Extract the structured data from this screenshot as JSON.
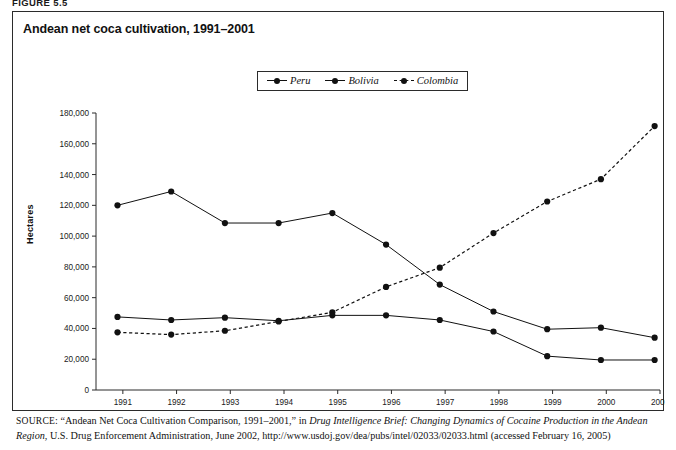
{
  "figure": {
    "label": "FIGURE 5.5",
    "title": "Andean net coca cultivation, 1991–2001"
  },
  "legend": {
    "items": [
      {
        "name": "Peru",
        "label": "Peru",
        "style": "solid",
        "color": "#111111"
      },
      {
        "name": "Bolivia",
        "label": "Bolivia",
        "style": "solid",
        "color": "#111111"
      },
      {
        "name": "Colombia",
        "label": "Colombia",
        "style": "dashed",
        "color": "#111111"
      }
    ]
  },
  "axes": {
    "y_title": "Hectares",
    "y_ticks": [
      "0",
      "20,000",
      "40,000",
      "60,000",
      "80,000",
      "100,000",
      "120,000",
      "140,000",
      "160,000",
      "180,000"
    ],
    "x_ticks": [
      "1991",
      "1992",
      "1993",
      "1994",
      "1995",
      "1996",
      "1997",
      "1998",
      "1999",
      "2000",
      "2001"
    ]
  },
  "source": {
    "prefix": "SOURCE",
    "part1": ": “Andean Net Coca Cultivation Comparison, 1991–2001,” in ",
    "italic1": "Drug Intelligence Brief: Changing Dynamics of Cocaine Production in the Andean Region",
    "part2": ", U.S. Drug Enforcement Administration, June 2002, http://www.usdoj.gov/dea/pubs/intel/02033/02033.html (accessed February 16, 2005)"
  },
  "chart_data": {
    "type": "line",
    "title": "Andean net coca cultivation, 1991–2001",
    "xlabel": "",
    "ylabel": "Hectares",
    "ylim": [
      0,
      180000
    ],
    "xlim": [
      1990.5,
      2001.0
    ],
    "ytick_step": 20000,
    "grid": false,
    "legend_position": "top-center",
    "x": [
      1990.9,
      1991.9,
      1992.9,
      1993.9,
      1994.9,
      1995.9,
      1996.9,
      1997.9,
      1998.9,
      1999.9,
      2000.9
    ],
    "xtick_labels": [
      "1991",
      "1992",
      "1993",
      "1994",
      "1995",
      "1996",
      "1997",
      "1998",
      "1999",
      "2000",
      "2001"
    ],
    "series": [
      {
        "name": "Peru",
        "style": "solid",
        "color": "#111111",
        "values": [
          120000,
          129000,
          108500,
          108500,
          115000,
          94500,
          68500,
          51000,
          39500,
          40500,
          34000
        ]
      },
      {
        "name": "Bolivia",
        "style": "solid",
        "color": "#111111",
        "values": [
          47500,
          45500,
          47000,
          45000,
          48500,
          48500,
          45500,
          38000,
          22000,
          19500,
          19500
        ]
      },
      {
        "name": "Colombia",
        "style": "dashed",
        "color": "#111111",
        "values": [
          37500,
          36000,
          38500,
          44500,
          50500,
          67000,
          79500,
          102000,
          122500,
          137000,
          171500
        ]
      }
    ]
  }
}
